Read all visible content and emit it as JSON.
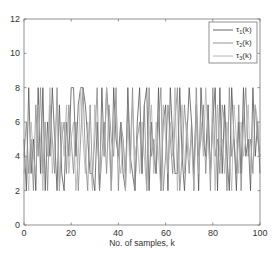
{
  "chart_data": {
    "type": "line",
    "title": "",
    "xlabel": "No. of samples, k",
    "ylabel": "",
    "xlim": [
      0,
      100
    ],
    "ylim": [
      0,
      12
    ],
    "xticks": [
      0,
      20,
      40,
      60,
      80,
      100
    ],
    "yticks": [
      0,
      2,
      4,
      6,
      8,
      10,
      12
    ],
    "grid": false,
    "legend_position": "upper right",
    "x": [
      0,
      1,
      2,
      3,
      4,
      5,
      6,
      7,
      8,
      9,
      10,
      11,
      12,
      13,
      14,
      15,
      16,
      17,
      18,
      19,
      20,
      21,
      22,
      23,
      24,
      25,
      26,
      27,
      28,
      29,
      30,
      31,
      32,
      33,
      34,
      35,
      36,
      37,
      38,
      39,
      40,
      41,
      42,
      43,
      44,
      45,
      46,
      47,
      48,
      49,
      50,
      51,
      52,
      53,
      54,
      55,
      56,
      57,
      58,
      59,
      60,
      61,
      62,
      63,
      64,
      65,
      66,
      67,
      68,
      69,
      70,
      71,
      72,
      73,
      74,
      75,
      76,
      77,
      78,
      79,
      80,
      81,
      82,
      83,
      84,
      85,
      86,
      87,
      88,
      89,
      90,
      91,
      92,
      93,
      94,
      95,
      96,
      97,
      98,
      99,
      100
    ],
    "series": [
      {
        "name": "τ1(k)",
        "legend_main": "τ",
        "legend_sub": "1",
        "legend_suffix": "(k)",
        "color": "#555555",
        "values": [
          5,
          2,
          8,
          3,
          5,
          2,
          8,
          3,
          8,
          2,
          6,
          4,
          8,
          5,
          2,
          7,
          3,
          2,
          6,
          4,
          8,
          8,
          4,
          7,
          8,
          8,
          7,
          5,
          3,
          3,
          2,
          6,
          2,
          8,
          4,
          8,
          6,
          2,
          8,
          5,
          4,
          6,
          3,
          2,
          8,
          4,
          3,
          2,
          6,
          8,
          3,
          7,
          8,
          2,
          6,
          4,
          3,
          8,
          2,
          6,
          7,
          2,
          8,
          5,
          3,
          3,
          8,
          4,
          2,
          5,
          8,
          6,
          3,
          7,
          2,
          8,
          5,
          4,
          7,
          3,
          6,
          8,
          2,
          8,
          3,
          7,
          4,
          2,
          8,
          5,
          2,
          6,
          3,
          8,
          4,
          5,
          2,
          8,
          4,
          6,
          3
        ]
      },
      {
        "name": "τ2(k)",
        "legend_main": "τ",
        "legend_sub": "2",
        "legend_suffix": "(k)",
        "color": "#888888",
        "values": [
          4,
          6,
          3,
          5,
          2,
          7,
          4,
          8,
          3,
          6,
          2,
          7,
          5,
          3,
          8,
          2,
          5,
          6,
          3,
          7,
          5,
          3,
          6,
          2,
          5,
          8,
          4,
          2,
          7,
          3,
          5,
          8,
          2,
          4,
          6,
          3,
          7,
          5,
          4,
          8,
          2,
          6,
          5,
          3,
          7,
          4,
          8,
          2,
          5,
          6,
          3,
          7,
          2,
          8,
          4,
          5,
          3,
          6,
          8,
          2,
          4,
          7,
          5,
          3,
          6,
          8,
          2,
          4,
          7,
          5,
          3,
          6,
          2,
          8,
          4,
          5,
          7,
          3,
          6,
          2,
          8,
          4,
          5,
          3,
          7,
          6,
          2,
          8,
          4,
          5,
          3,
          7,
          2,
          6,
          8,
          4,
          5,
          3,
          7,
          5,
          4
        ]
      },
      {
        "name": "τ3(k)",
        "legend_main": "τ",
        "legend_sub": "3",
        "legend_suffix": "(k)",
        "color": "#b0b0b0",
        "values": [
          3,
          4,
          2,
          6,
          4,
          3,
          7,
          5,
          2,
          6,
          4,
          8,
          3,
          5,
          7,
          2,
          6,
          4,
          7,
          3,
          5,
          6,
          2,
          4,
          8,
          5,
          3,
          6,
          4,
          2,
          7,
          5,
          3,
          6,
          4,
          8,
          5,
          2,
          6,
          7,
          4,
          3,
          5,
          2,
          6,
          3,
          7,
          4,
          5,
          3,
          6,
          4,
          2,
          5,
          7,
          3,
          6,
          4,
          2,
          7,
          5,
          3,
          6,
          4,
          8,
          2,
          5,
          7,
          3,
          6,
          4,
          5,
          2,
          7,
          3,
          6,
          4,
          8,
          5,
          3,
          6,
          2,
          7,
          4,
          5,
          3,
          6,
          4,
          2,
          7,
          5,
          3,
          6,
          4,
          5,
          7,
          3,
          6,
          7,
          6,
          4
        ]
      }
    ]
  },
  "axes": {
    "xlabel": "No. of samples, k",
    "xtick_labels": [
      "0",
      "20",
      "40",
      "60",
      "80",
      "100"
    ],
    "ytick_labels": [
      "0",
      "2",
      "4",
      "6",
      "8",
      "10",
      "12"
    ]
  },
  "legend": {
    "entries": [
      {
        "main": "τ",
        "sub": "1",
        "suffix": "(k)"
      },
      {
        "main": "τ",
        "sub": "2",
        "suffix": "(k)"
      },
      {
        "main": "τ",
        "sub": "3",
        "suffix": "(k)"
      }
    ]
  }
}
